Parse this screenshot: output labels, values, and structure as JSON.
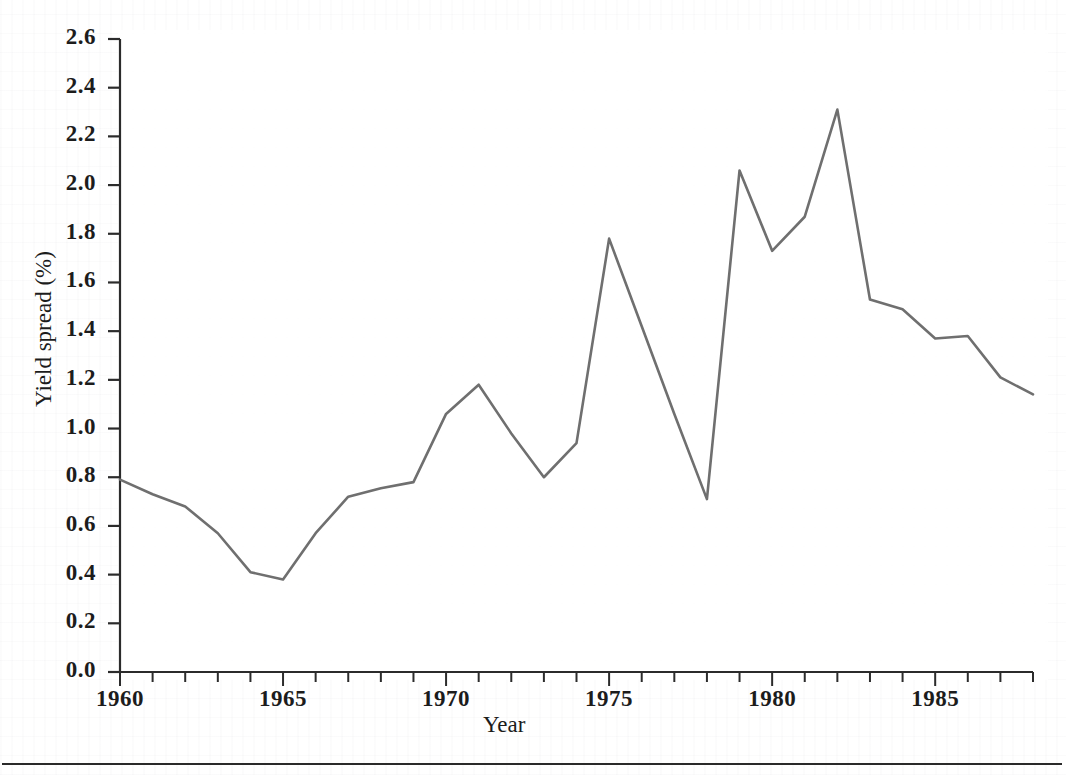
{
  "figure": {
    "background_color": "#ffffff",
    "axis_color": "#2b2b2b",
    "line_color": "#6f6f6f",
    "text_color": "#1c1c1c",
    "page_rule": true
  },
  "chart_data": {
    "type": "line",
    "title": "",
    "xlabel": "Year",
    "ylabel": "Yield spread (%)",
    "xlim": [
      1960,
      1988
    ],
    "ylim": [
      0.0,
      2.6
    ],
    "grid": false,
    "legend": null,
    "x_tick_labels": [
      "1960",
      "1965",
      "1970",
      "1975",
      "1980",
      "1985"
    ],
    "x_tick_values": [
      1960,
      1965,
      1970,
      1975,
      1980,
      1985
    ],
    "x_minor_tick_interval": 1,
    "y_tick_labels": [
      "0.0",
      "0.2",
      "0.4",
      "0.6",
      "0.8",
      "1.0",
      "1.2",
      "1.4",
      "1.6",
      "1.8",
      "2.0",
      "2.2",
      "2.4",
      "2.6"
    ],
    "y_tick_values": [
      0.0,
      0.2,
      0.4,
      0.6,
      0.8,
      1.0,
      1.2,
      1.4,
      1.6,
      1.8,
      2.0,
      2.2,
      2.4,
      2.6
    ],
    "series": [
      {
        "name": "Yield spread",
        "color": "#6f6f6f",
        "x": [
          1960,
          1961,
          1962,
          1963,
          1964,
          1965,
          1966,
          1967,
          1968,
          1969,
          1970,
          1971,
          1972,
          1973,
          1974,
          1975,
          1976,
          1977,
          1978,
          1979,
          1980,
          1981,
          1982,
          1983,
          1984,
          1985,
          1986,
          1987,
          1988
        ],
        "values": [
          0.79,
          0.73,
          0.68,
          0.57,
          0.41,
          0.38,
          0.57,
          0.72,
          0.755,
          0.78,
          1.06,
          1.18,
          0.98,
          0.8,
          0.94,
          1.78,
          1.42,
          1.06,
          0.71,
          2.06,
          1.73,
          1.87,
          2.31,
          1.53,
          1.49,
          1.37,
          1.38,
          1.21,
          1.14
        ]
      }
    ]
  }
}
